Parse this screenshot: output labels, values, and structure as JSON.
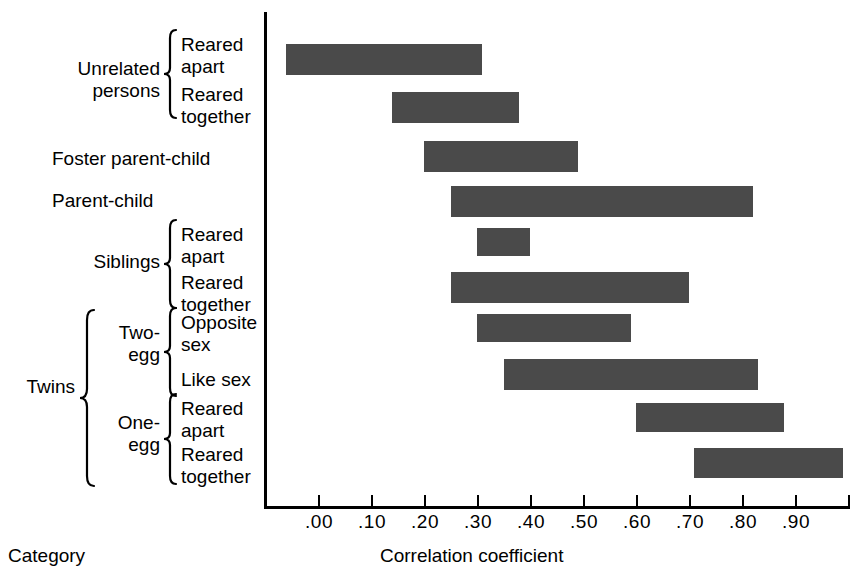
{
  "chart_data": {
    "type": "bar",
    "orientation": "horizontal",
    "subtype": "range-bar",
    "title": "",
    "xlabel": "Correlation coefficient",
    "ylabel": "Category",
    "xlim": [
      -0.06,
      1.0
    ],
    "grid": false,
    "legend": null,
    "xticks": [
      ".00",
      ".10",
      ".20",
      ".30",
      ".40",
      ".50",
      ".60",
      ".70",
      ".80",
      ".90"
    ],
    "xtick_values": [
      0.0,
      0.1,
      0.2,
      0.3,
      0.4,
      0.5,
      0.6,
      0.7,
      0.8,
      0.9
    ],
    "categories": [
      "Unrelated persons — Reared apart",
      "Unrelated persons — Reared together",
      "Foster parent-child",
      "Parent-child",
      "Siblings — Reared apart",
      "Siblings — Reared together",
      "Twins — Two-egg — Opposite sex",
      "Twins — Two-egg — Like sex",
      "Twins — One-egg — Reared apart",
      "Twins — One-egg — Reared together"
    ],
    "bars": [
      {
        "label": "Unrelated persons — Reared apart",
        "start": -0.06,
        "end": 0.31
      },
      {
        "label": "Unrelated persons — Reared together",
        "start": 0.14,
        "end": 0.38
      },
      {
        "label": "Foster parent-child",
        "start": 0.2,
        "end": 0.49
      },
      {
        "label": "Parent-child",
        "start": 0.25,
        "end": 0.82
      },
      {
        "label": "Siblings — Reared apart",
        "start": 0.3,
        "end": 0.4
      },
      {
        "label": "Siblings — Reared together",
        "start": 0.25,
        "end": 0.7
      },
      {
        "label": "Twins — Two-egg — Opposite sex",
        "start": 0.3,
        "end": 0.59
      },
      {
        "label": "Twins — Two-egg — Like sex",
        "start": 0.35,
        "end": 0.83
      },
      {
        "label": "Twins — One-egg — Reared apart",
        "start": 0.6,
        "end": 0.88
      },
      {
        "label": "Twins — One-egg — Reared together",
        "start": 0.71,
        "end": 0.99
      }
    ],
    "bar_color": "#4a4a4a",
    "axis_color": "#000000"
  },
  "labels": {
    "unrelated_persons": "Unrelated\npersons",
    "unrelated_reared_apart": "Reared\napart",
    "unrelated_reared_together": "Reared\ntogether",
    "foster_parent_child": "Foster parent-child",
    "parent_child": "Parent-child",
    "siblings": "Siblings",
    "siblings_reared_apart": "Reared\napart",
    "siblings_reared_together": "Reared\ntogether",
    "twins": "Twins",
    "two_egg": "Two-\negg",
    "two_egg_opposite_sex": "Opposite\nsex",
    "two_egg_like_sex": "Like sex",
    "one_egg": "One-\negg",
    "one_egg_reared_apart": "Reared\napart",
    "one_egg_reared_together": "Reared\ntogether"
  },
  "captions": {
    "category": "Category",
    "correlation_coefficient": "Correlation coefficient"
  },
  "ticks": {
    "t0": ".00",
    "t1": ".10",
    "t2": ".20",
    "t3": ".30",
    "t4": ".40",
    "t5": ".50",
    "t6": ".60",
    "t7": ".70",
    "t8": ".80",
    "t9": ".90"
  }
}
